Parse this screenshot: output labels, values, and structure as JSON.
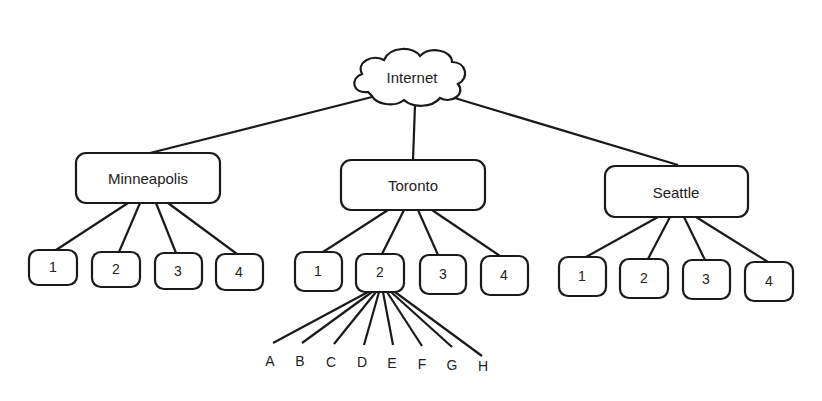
{
  "diagram": {
    "root": {
      "label": "Internet",
      "shape": "cloud"
    },
    "sites": [
      {
        "label": "Minneapolis",
        "children": [
          "1",
          "2",
          "3",
          "4"
        ]
      },
      {
        "label": "Toronto",
        "children": [
          "1",
          "2",
          "3",
          "4"
        ]
      },
      {
        "label": "Seattle",
        "children": [
          "1",
          "2",
          "3",
          "4"
        ]
      }
    ],
    "expanded": {
      "site": "Toronto",
      "child": "2",
      "leaves": [
        "A",
        "B",
        "C",
        "D",
        "E",
        "F",
        "G",
        "H"
      ]
    },
    "colors": {
      "stroke": "#1a1a1a",
      "background": "#ffffff",
      "text": "#222222"
    }
  }
}
